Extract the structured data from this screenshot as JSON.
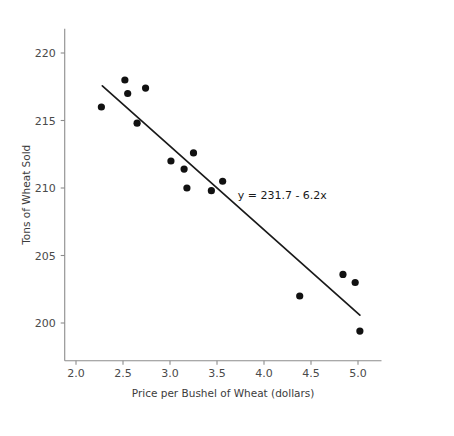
{
  "chart_data": {
    "type": "scatter",
    "title": "",
    "xlabel": "Price per Bushel of Wheat (dollars)",
    "ylabel": "Tons of Wheat Sold",
    "xlim": [
      1.88,
      5.25
    ],
    "ylim": [
      197.2,
      221.8
    ],
    "xticks": [
      "2.0",
      "2.5",
      "3.0",
      "3.5",
      "4.0",
      "4.5",
      "5.0"
    ],
    "xtick_values": [
      2.0,
      2.5,
      3.0,
      3.5,
      4.0,
      4.5,
      5.0
    ],
    "yticks": [
      "200",
      "205",
      "210",
      "215",
      "220"
    ],
    "ytick_values": [
      200,
      205,
      210,
      215,
      220
    ],
    "grid": false,
    "legend": null,
    "marker_color": "#111111",
    "line_color": "#1a1a1a",
    "axis_color": "#8c8c8c",
    "x": [
      2.27,
      2.52,
      2.55,
      2.65,
      2.74,
      3.01,
      3.15,
      3.18,
      3.25,
      3.44,
      3.56,
      4.38,
      4.84,
      4.97,
      5.02
    ],
    "y": [
      216.0,
      218.0,
      217.0,
      214.8,
      217.4,
      212.0,
      211.4,
      210.0,
      212.6,
      209.8,
      210.5,
      202.0,
      203.6,
      203.0,
      199.4
    ],
    "points": [
      {
        "x": 2.27,
        "y": 216.0
      },
      {
        "x": 2.52,
        "y": 218.0
      },
      {
        "x": 2.55,
        "y": 217.0
      },
      {
        "x": 2.65,
        "y": 214.8
      },
      {
        "x": 2.74,
        "y": 217.4
      },
      {
        "x": 3.01,
        "y": 212.0
      },
      {
        "x": 3.15,
        "y": 211.4
      },
      {
        "x": 3.18,
        "y": 210.0
      },
      {
        "x": 3.25,
        "y": 212.6
      },
      {
        "x": 3.44,
        "y": 209.8
      },
      {
        "x": 3.56,
        "y": 210.5
      },
      {
        "x": 4.38,
        "y": 202.0
      },
      {
        "x": 4.84,
        "y": 203.6
      },
      {
        "x": 4.97,
        "y": 203.0
      },
      {
        "x": 5.02,
        "y": 199.4
      }
    ],
    "trendline": {
      "equation_text": "y = 231.7 - 6.2x",
      "intercept": 231.7,
      "slope": -6.2,
      "x_start": 2.28,
      "x_end": 5.02,
      "y_start": 217.56,
      "y_end": 200.58
    },
    "annotations": [
      {
        "text": "y = 231.7 - 6.2x",
        "x": 3.72,
        "y": 209.2
      }
    ]
  }
}
